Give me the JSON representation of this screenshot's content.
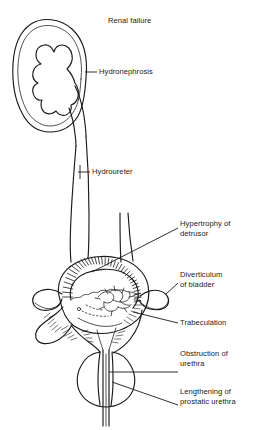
{
  "figure": {
    "title": "Renal failure",
    "ink_color": "#1a1a1a",
    "background_color": "#ffffff"
  },
  "labels": [
    {
      "id": "renal-failure",
      "text": "Renal failure",
      "x": 108,
      "y": 16,
      "has_leader": false
    },
    {
      "id": "hydronephrosis",
      "text": "Hydronephrosis",
      "x": 99,
      "y": 69,
      "has_leader": true
    },
    {
      "id": "hydroureter",
      "text": "Hydroureter",
      "x": 92,
      "y": 168,
      "has_leader": true
    },
    {
      "id": "hypertrophy-of-detrusor",
      "text": "Hypertrophy  of\ndetrusor",
      "x": 180,
      "y": 221,
      "has_leader": true
    },
    {
      "id": "diverticulum-of-bladder",
      "text": "Diverticulum\nof bladder",
      "x": 180,
      "y": 271,
      "has_leader": true
    },
    {
      "id": "trabeculation",
      "text": "Trabeculation",
      "x": 180,
      "y": 320,
      "has_leader": true
    },
    {
      "id": "obstruction-of-urethra",
      "text": "Obstruction of\nurethra",
      "x": 180,
      "y": 350,
      "has_leader": true
    },
    {
      "id": "lengthening-of-prostatic-urethra",
      "text": "Lengthening of\nprostatic urethra",
      "x": 180,
      "y": 388,
      "has_leader": true
    }
  ],
  "anatomy": [
    {
      "id": "kidney",
      "name": "hydronephrotic-kidney"
    },
    {
      "id": "calyces",
      "name": "dilated-calyces"
    },
    {
      "id": "ureter",
      "name": "dilated-ureter"
    },
    {
      "id": "bladder",
      "name": "bladder"
    },
    {
      "id": "detrusor-hatching",
      "name": "hypertrophied-detrusor-muscle"
    },
    {
      "id": "diverticulum-right",
      "name": "right-bladder-diverticulum"
    },
    {
      "id": "diverticulum-left",
      "name": "left-bladder-diverticulum"
    },
    {
      "id": "trabeculae",
      "name": "bladder-trabeculae"
    },
    {
      "id": "prostate",
      "name": "enlarged-prostate"
    },
    {
      "id": "urethra",
      "name": "lengthened-prostatic-urethra"
    }
  ]
}
